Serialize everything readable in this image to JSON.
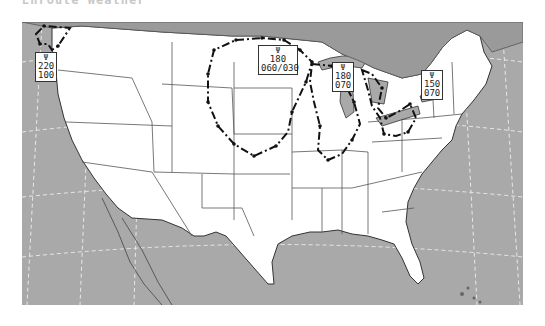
{
  "header": {
    "title": "Enroute Weather"
  },
  "map": {
    "region": "Continental United States",
    "colors": {
      "land": "#ffffff",
      "water": "#a9a9a9",
      "state_border": "#555555",
      "county_border": "#cccccc",
      "outline": "#222222"
    },
    "areas": [
      {
        "id": "pacific-northwest",
        "icon": "turbulence-icon",
        "top": "220",
        "bottom": "100"
      },
      {
        "id": "upper-midwest",
        "icon": "turbulence-icon",
        "top": "180",
        "bottom": "060/030"
      },
      {
        "id": "michigan",
        "icon": "turbulence-icon",
        "top": "180",
        "bottom": "070"
      },
      {
        "id": "northeast",
        "icon": "turbulence-icon",
        "top": "150",
        "bottom": "070"
      }
    ]
  }
}
